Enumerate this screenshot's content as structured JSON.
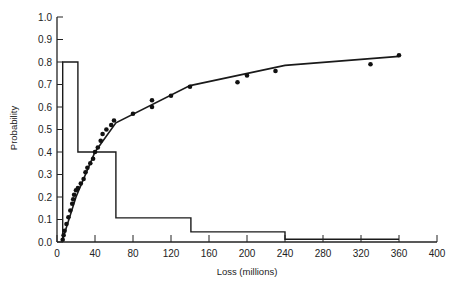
{
  "chart_data": {
    "type": "line",
    "title": "",
    "xlabel": "Loss (millions)",
    "ylabel": "Probability",
    "xlim": [
      0,
      400
    ],
    "ylim": [
      0,
      1.0
    ],
    "x_ticks": [
      0,
      40,
      80,
      120,
      160,
      200,
      240,
      280,
      320,
      360,
      400
    ],
    "y_ticks": [
      "0.0",
      "0.1",
      "0.2",
      "0.3",
      "0.4",
      "0.5",
      "0.6",
      "0.7",
      "0.8",
      "0.9",
      "1.0"
    ],
    "grid": false,
    "legend": null,
    "series": [
      {
        "name": "Probability density (histogram)",
        "kind": "step",
        "points": [
          [
            6,
            0
          ],
          [
            6,
            0.8
          ],
          [
            22,
            0.8
          ],
          [
            22,
            0.4
          ],
          [
            62,
            0.4
          ],
          [
            62,
            0.107
          ],
          [
            141,
            0.107
          ],
          [
            141,
            0.045
          ],
          [
            240,
            0.045
          ],
          [
            240,
            0.012
          ],
          [
            360,
            0.012
          ]
        ]
      },
      {
        "name": "Fitted cumulative curve",
        "kind": "line",
        "points": [
          [
            5,
            0.0
          ],
          [
            20,
            0.2
          ],
          [
            40,
            0.4
          ],
          [
            62,
            0.53
          ],
          [
            140,
            0.695
          ],
          [
            240,
            0.785
          ],
          [
            360,
            0.825
          ]
        ]
      },
      {
        "name": "Observed cumulative data",
        "kind": "scatter",
        "points": [
          [
            6,
            0.01
          ],
          [
            7,
            0.03
          ],
          [
            8,
            0.05
          ],
          [
            10,
            0.08
          ],
          [
            12,
            0.11
          ],
          [
            14,
            0.14
          ],
          [
            16,
            0.17
          ],
          [
            17,
            0.19
          ],
          [
            18,
            0.21
          ],
          [
            20,
            0.23
          ],
          [
            22,
            0.24
          ],
          [
            25,
            0.26
          ],
          [
            28,
            0.28
          ],
          [
            30,
            0.31
          ],
          [
            32,
            0.33
          ],
          [
            35,
            0.35
          ],
          [
            38,
            0.37
          ],
          [
            40,
            0.4
          ],
          [
            43,
            0.42
          ],
          [
            46,
            0.45
          ],
          [
            48,
            0.48
          ],
          [
            52,
            0.5
          ],
          [
            57,
            0.52
          ],
          [
            60,
            0.54
          ],
          [
            80,
            0.57
          ],
          [
            100,
            0.6
          ],
          [
            100,
            0.63
          ],
          [
            120,
            0.65
          ],
          [
            140,
            0.69
          ],
          [
            190,
            0.71
          ],
          [
            200,
            0.74
          ],
          [
            230,
            0.76
          ],
          [
            330,
            0.79
          ],
          [
            360,
            0.83
          ]
        ]
      }
    ]
  }
}
